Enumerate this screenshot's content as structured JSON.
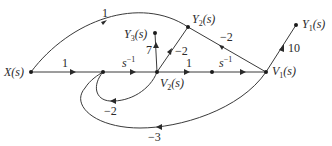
{
  "diagram": {
    "type": "signal-flow-graph",
    "nodes": {
      "X": {
        "label": "X(s)",
        "x": 31,
        "y": 72
      },
      "N2": {
        "label": "",
        "x": 103,
        "y": 72
      },
      "V2": {
        "label": "V₂(s)",
        "x": 157,
        "y": 72
      },
      "N4": {
        "label": "",
        "x": 212,
        "y": 72
      },
      "V1": {
        "label": "V₁(s)",
        "x": 266,
        "y": 72
      },
      "Y1": {
        "label": "Y₁(s)",
        "x": 296,
        "y": 25
      },
      "Y2": {
        "label": "Y₂(s)",
        "x": 188,
        "y": 27
      },
      "Y3": {
        "label": "Y₃(s)",
        "x": 155,
        "y": 33
      }
    },
    "branches": [
      {
        "from": "X",
        "to": "N2",
        "gain": "1"
      },
      {
        "from": "N2",
        "to": "V2",
        "gain": "s⁻¹"
      },
      {
        "from": "V2",
        "to": "N4",
        "gain": "1"
      },
      {
        "from": "N4",
        "to": "V1",
        "gain": "s⁻¹"
      },
      {
        "from": "X",
        "to": "Y2",
        "gain": "1"
      },
      {
        "from": "V2",
        "to": "Y3",
        "gain": "7"
      },
      {
        "from": "V2",
        "to": "Y2",
        "gain": "−2"
      },
      {
        "from": "V1",
        "to": "Y2",
        "gain": "−2"
      },
      {
        "from": "V1",
        "to": "Y1",
        "gain": "10"
      },
      {
        "from": "V2",
        "to": "N2",
        "gain": "−2"
      },
      {
        "from": "V1",
        "to": "N2",
        "gain": "−3"
      }
    ]
  },
  "labels": {
    "x": "X(s)",
    "v1": "V",
    "v1_sub": "1",
    "v2": "V",
    "v2_sub": "2",
    "y1": "Y",
    "y1_sub": "1",
    "y2": "Y",
    "y2_sub": "2",
    "y3": "Y",
    "y3_sub": "3",
    "s_arg": "(s)",
    "gain_x_n2": "1",
    "gain_n2_v2_base": "s",
    "gain_n2_v2_exp": "−1",
    "gain_v2_n4": "1",
    "gain_n4_v1_base": "s",
    "gain_n4_v1_exp": "−1",
    "gain_x_y2": "1",
    "gain_v2_y3": "7",
    "gain_v2_y2": "−2",
    "gain_v1_y2": "−2",
    "gain_v1_y1": "10",
    "gain_v2_n2": "−2",
    "gain_v1_n2": "−3"
  }
}
